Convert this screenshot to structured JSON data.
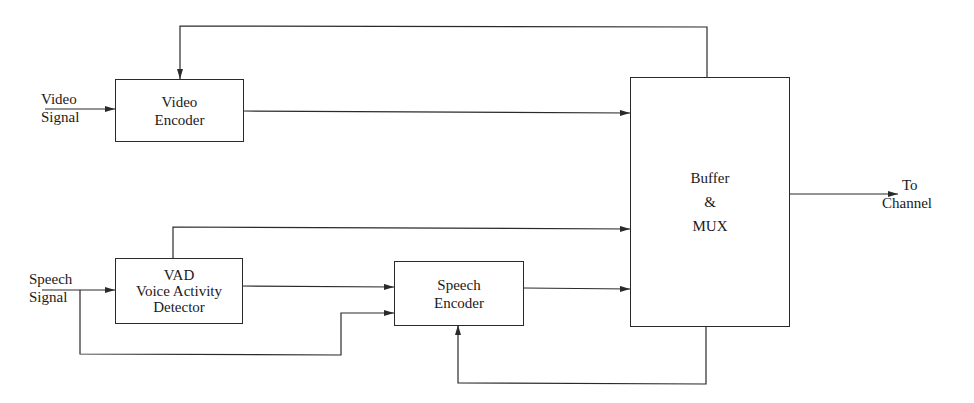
{
  "diagram": {
    "blocks": {
      "video_encoder": {
        "line1": "Video",
        "line2": "Encoder"
      },
      "vad": {
        "line1": "VAD",
        "line2": "Voice Activity",
        "line3": "Detector"
      },
      "speech_encoder": {
        "line1": "Speech",
        "line2": "Encoder"
      },
      "buffer_mux": {
        "line1": "Buffer",
        "line2": "&",
        "line3": "MUX"
      }
    },
    "inputs": {
      "video_signal": {
        "line1": "Video",
        "line2": "Signal"
      },
      "speech_signal": {
        "line1": "Speech",
        "line2": "Signal"
      }
    },
    "output": {
      "line1": "To",
      "line2": "Channel"
    },
    "edges": [
      {
        "from": "Video Signal",
        "to": "Video Encoder"
      },
      {
        "from": "Video Encoder",
        "to": "Buffer & MUX"
      },
      {
        "from": "Buffer & MUX",
        "to": "Video Encoder",
        "type": "feedback"
      },
      {
        "from": "Speech Signal",
        "to": "VAD"
      },
      {
        "from": "Speech Signal",
        "to": "Speech Encoder"
      },
      {
        "from": "VAD",
        "to": "Speech Encoder"
      },
      {
        "from": "VAD",
        "to": "Buffer & MUX"
      },
      {
        "from": "Speech Encoder",
        "to": "Buffer & MUX"
      },
      {
        "from": "Buffer & MUX",
        "to": "Speech Encoder",
        "type": "feedback"
      },
      {
        "from": "Buffer & MUX",
        "to": "To Channel"
      }
    ],
    "colors": {
      "line": "#2a2a2a",
      "background": "#ffffff"
    }
  }
}
